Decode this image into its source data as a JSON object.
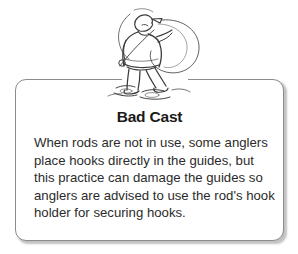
{
  "page": {
    "background_color": "#ffffff",
    "width": 298,
    "height": 254
  },
  "card": {
    "title": "Bad Cast",
    "border_color": "#8c8c8c",
    "background_color": "#ffffff",
    "body_lines": [
      "When rods are not in use, some anglers",
      "place hooks directly in the guides, but",
      "this practice can damage the guides so",
      "anglers are advised to use the rod's hook",
      "holder for securing hooks."
    ],
    "body_text": "When rods are not in use, some anglers place hooks directly in the guides, but this practice can damage the guides so anglers are advised to use the rod's hook holder for securing hooks."
  },
  "illustration": {
    "name": "angler-bad-cast-illustration",
    "description": "Line drawing of an angler seen from behind wearing a cap, standing in shallow water, casting a fishing rod with a tangled line loop",
    "ink_color": "#3a3a3a"
  }
}
